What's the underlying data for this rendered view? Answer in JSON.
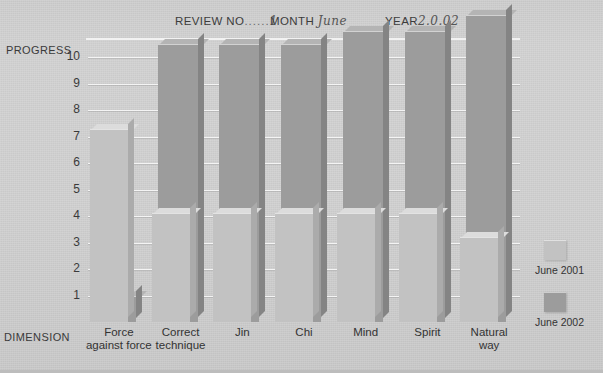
{
  "header": {
    "review_label": "REVIEW NO",
    "review_dots": "......",
    "review_value": "1",
    "month_label": "MONTH",
    "month_value": "June",
    "year_label": "YEAR",
    "year_value": "2.0.02"
  },
  "axis": {
    "y_title": "PROGRESS",
    "x_title": "DIMENSION",
    "y_ticks": [
      "10",
      "9",
      "8",
      "7",
      "6",
      "5",
      "4",
      "3",
      "2",
      "1"
    ]
  },
  "legend": {
    "items": [
      {
        "label": "June 2001",
        "color": "#c2c2c2"
      },
      {
        "label": "June 2002",
        "color": "#9c9c9c"
      }
    ]
  },
  "chart_data": {
    "type": "bar",
    "title": "PROGRESS",
    "xlabel": "DIMENSION",
    "ylabel": "PROGRESS",
    "ylim": [
      0,
      11.8
    ],
    "grid": true,
    "legend_position": "right",
    "categories": [
      "Force against force",
      "Correct technique",
      "Jin",
      "Chi",
      "Mind",
      "Spirit",
      "Natural way"
    ],
    "categories_lines": [
      [
        "Force",
        "against force"
      ],
      [
        "Correct",
        "technique"
      ],
      [
        "Jin",
        ""
      ],
      [
        "Chi",
        ""
      ],
      [
        "Mind",
        ""
      ],
      [
        "Spirit",
        ""
      ],
      [
        "Natural",
        "way"
      ]
    ],
    "series": [
      {
        "name": "June 2001",
        "color": "#c2c2c2",
        "values": [
          7.3,
          4.1,
          4.1,
          4.1,
          4.1,
          4.1,
          3.2
        ]
      },
      {
        "name": "June 2002",
        "color": "#9c9c9c",
        "values": [
          1.0,
          10.5,
          10.5,
          10.5,
          11.0,
          11.0,
          11.6
        ]
      }
    ]
  }
}
